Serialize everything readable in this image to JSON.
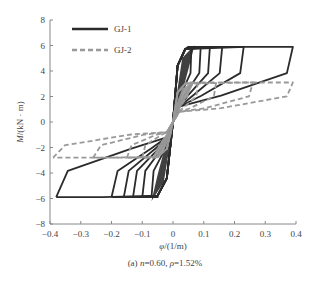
{
  "chart_data": {
    "type": "line",
    "title": "",
    "caption": "(a) n=0.60, ρ=1.52%",
    "caption_parts": {
      "prefix": "(a) ",
      "n_sym": "n",
      "n_val": "=0.60, ",
      "rho_sym": "ρ",
      "rho_val": "=1.52%"
    },
    "xlabel": "φ/(1/m)",
    "ylabel": "M/(kN · m)",
    "xlim": [
      -0.4,
      0.4
    ],
    "ylim": [
      -8,
      8
    ],
    "xticks": [
      "-0.4",
      "-0.3",
      "-0.2",
      "-0.1",
      "0",
      "0.1",
      "0.2",
      "0.3",
      "0.4"
    ],
    "yticks": [
      "8",
      "6",
      "4",
      "2",
      "0",
      "-2",
      "-4",
      "-6",
      "-8"
    ],
    "grid": false,
    "legend_position": "upper-left",
    "series": [
      {
        "name": "GJ-1",
        "style": "solid",
        "color": "#2b2b2b",
        "description": "Hysteresis loops (moment vs curvature), envelope peaks approx +5.9 kN·m at φ≈+0.39 and -5.9 kN·m at φ≈-0.38",
        "envelope_pos": [
          [
            0.0,
            0.0
          ],
          [
            0.02,
            4.5
          ],
          [
            0.05,
            5.8
          ],
          [
            0.1,
            6.0
          ],
          [
            0.2,
            5.9
          ],
          [
            0.3,
            5.9
          ],
          [
            0.39,
            5.9
          ]
        ],
        "envelope_neg": [
          [
            0.0,
            0.0
          ],
          [
            -0.03,
            -4.5
          ],
          [
            -0.06,
            -6.2
          ],
          [
            -0.1,
            -6.0
          ],
          [
            -0.2,
            -6.0
          ],
          [
            -0.3,
            -5.9
          ],
          [
            -0.38,
            -5.9
          ]
        ],
        "loop_peaks_pos_phi": [
          0.06,
          0.09,
          0.12,
          0.16,
          0.23,
          0.39
        ],
        "loop_peaks_neg_phi": [
          -0.07,
          -0.1,
          -0.13,
          -0.16,
          -0.2,
          -0.38
        ]
      },
      {
        "name": "GJ-2",
        "style": "dashed",
        "color": "#999999",
        "description": "Hysteresis loops (moment vs curvature), envelope peaks approx +3.1 kN·m at φ≈+0.39 and -2.8 kN·m at φ≈-0.39",
        "envelope_pos": [
          [
            0.0,
            0.0
          ],
          [
            0.02,
            2.5
          ],
          [
            0.05,
            3.2
          ],
          [
            0.1,
            3.3
          ],
          [
            0.2,
            3.2
          ],
          [
            0.3,
            3.1
          ],
          [
            0.39,
            3.1
          ]
        ],
        "envelope_neg": [
          [
            0.0,
            0.0
          ],
          [
            -0.02,
            -2.5
          ],
          [
            -0.05,
            -3.5
          ],
          [
            -0.1,
            -3.0
          ],
          [
            -0.2,
            -2.9
          ],
          [
            -0.3,
            -2.8
          ],
          [
            -0.39,
            -2.8
          ]
        ],
        "loop_peaks_pos_phi": [
          0.05,
          0.08,
          0.14,
          0.26,
          0.39
        ],
        "loop_peaks_neg_phi": [
          -0.05,
          -0.1,
          -0.15,
          -0.26,
          -0.39
        ]
      }
    ]
  },
  "legend": {
    "items": [
      {
        "label": "GJ-1"
      },
      {
        "label": "GJ-2"
      }
    ]
  }
}
